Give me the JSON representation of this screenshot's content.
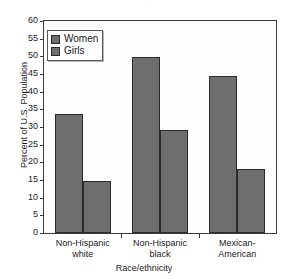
{
  "chart_data": {
    "type": "bar",
    "title": "United States, 2007–2008",
    "title_lines": [
      "",
      "United States, 2007–2008"
    ],
    "xlabel": "Race/ethnicity",
    "ylabel": "Percent of U.S. Population",
    "categories": [
      "Non-Hispanic white",
      "Non-Hispanic black",
      "Mexican-American"
    ],
    "category_lines": [
      [
        "Non-Hispanic",
        "white"
      ],
      [
        "Non-Hispanic",
        "black"
      ],
      [
        "Mexican-",
        "American"
      ]
    ],
    "series": [
      {
        "name": "Women",
        "values": [
          33.6,
          49.9,
          44.3
        ],
        "color": "#6e6e6e"
      },
      {
        "name": "Girls",
        "values": [
          14.6,
          29.2,
          18.2
        ],
        "color": "#6e6e6e"
      }
    ],
    "ylim": [
      0,
      60
    ],
    "yticks": [
      0,
      5,
      10,
      15,
      20,
      25,
      30,
      35,
      40,
      45,
      50,
      55,
      60
    ],
    "ytick_labels": [
      "0",
      "5",
      "10",
      "15",
      "20",
      "25",
      "30",
      "35",
      "40",
      "45",
      "50",
      "55",
      "60"
    ],
    "grid": false,
    "legend_position": "top-left",
    "legend_entries": [
      "Women",
      "Girls"
    ]
  }
}
